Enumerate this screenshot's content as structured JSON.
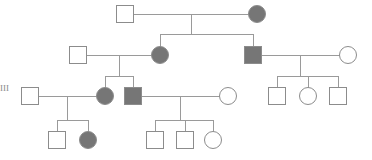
{
  "chart_data": {
    "type": "diagram",
    "diagram_kind": "pedigree",
    "canvas": {
      "width": 372,
      "height": 160,
      "background": "#ffffff"
    },
    "style": {
      "affected_fill": "#767676",
      "unaffected_fill": "#ffffff",
      "symbol_stroke": "#8c8c8c",
      "line_stroke": "#9a9a9a",
      "stroke_width": 1,
      "square_size": 17,
      "circle_radius": 8.5
    },
    "legend": {
      "square_meaning": "male",
      "circle_meaning": "female",
      "filled_meaning": "affected",
      "open_meaning": "unaffected"
    },
    "generation_labels": [
      {
        "id": "gen-label-iii",
        "text": "III",
        "x": 0,
        "y": 84
      }
    ],
    "generations": [
      {
        "id": "I",
        "y": 14,
        "individuals": [
          {
            "id": "I-1",
            "shape": "square",
            "sex": "male",
            "affected": false,
            "x": 125,
            "y": 14
          },
          {
            "id": "I-2",
            "shape": "circle",
            "sex": "female",
            "affected": true,
            "x": 257,
            "y": 14
          }
        ]
      },
      {
        "id": "II",
        "y": 55,
        "individuals": [
          {
            "id": "II-1",
            "shape": "square",
            "sex": "male",
            "affected": false,
            "x": 78,
            "y": 55
          },
          {
            "id": "II-2",
            "shape": "circle",
            "sex": "female",
            "affected": true,
            "x": 160,
            "y": 55
          },
          {
            "id": "II-3",
            "shape": "square",
            "sex": "male",
            "affected": true,
            "x": 253,
            "y": 55
          },
          {
            "id": "II-4",
            "shape": "circle",
            "sex": "female",
            "affected": false,
            "x": 348,
            "y": 55
          }
        ]
      },
      {
        "id": "III",
        "y": 96,
        "individuals": [
          {
            "id": "III-1",
            "shape": "square",
            "sex": "male",
            "affected": false,
            "x": 30,
            "y": 96
          },
          {
            "id": "III-2",
            "shape": "circle",
            "sex": "female",
            "affected": true,
            "x": 105,
            "y": 96
          },
          {
            "id": "III-3",
            "shape": "square",
            "sex": "male",
            "affected": true,
            "x": 133,
            "y": 96
          },
          {
            "id": "III-4",
            "shape": "circle",
            "sex": "female",
            "affected": false,
            "x": 228,
            "y": 96
          },
          {
            "id": "III-5",
            "shape": "square",
            "sex": "male",
            "affected": false,
            "x": 277,
            "y": 96
          },
          {
            "id": "III-6",
            "shape": "circle",
            "sex": "female",
            "affected": false,
            "x": 308,
            "y": 96
          },
          {
            "id": "III-7",
            "shape": "square",
            "sex": "male",
            "affected": false,
            "x": 338,
            "y": 96
          }
        ]
      },
      {
        "id": "IV",
        "y": 140,
        "individuals": [
          {
            "id": "IV-1",
            "shape": "square",
            "sex": "male",
            "affected": false,
            "x": 57,
            "y": 140
          },
          {
            "id": "IV-2",
            "shape": "circle",
            "sex": "female",
            "affected": true,
            "x": 88,
            "y": 140
          },
          {
            "id": "IV-3",
            "shape": "square",
            "sex": "male",
            "affected": false,
            "x": 155,
            "y": 140
          },
          {
            "id": "IV-4",
            "shape": "square",
            "sex": "male",
            "affected": false,
            "x": 185,
            "y": 140
          },
          {
            "id": "IV-5",
            "shape": "circle",
            "sex": "female",
            "affected": false,
            "x": 213,
            "y": 140
          }
        ]
      }
    ],
    "matings": [
      {
        "id": "mating-1",
        "partners": [
          "I-1",
          "I-2"
        ],
        "children": [
          "II-2",
          "II-3"
        ],
        "y": 14,
        "sib_y": 34
      },
      {
        "id": "mating-2",
        "partners": [
          "II-1",
          "II-2"
        ],
        "children": [
          "III-2",
          "III-3"
        ],
        "y": 55,
        "sib_y": 76
      },
      {
        "id": "mating-3",
        "partners": [
          "II-3",
          "II-4"
        ],
        "children": [
          "III-5",
          "III-6",
          "III-7"
        ],
        "y": 55,
        "sib_y": 76
      },
      {
        "id": "mating-4",
        "partners": [
          "III-1",
          "III-2"
        ],
        "children": [
          "IV-1",
          "IV-2"
        ],
        "y": 96,
        "sib_y": 120
      },
      {
        "id": "mating-5",
        "partners": [
          "III-3",
          "III-4"
        ],
        "children": [
          "IV-3",
          "IV-4",
          "IV-5"
        ],
        "y": 96,
        "sib_y": 120
      }
    ]
  }
}
